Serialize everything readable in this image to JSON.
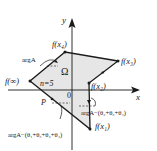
{
  "diagram": {
    "type": "conformal-polygon-map",
    "axes": {
      "x_label": "x",
      "y_label": "y",
      "origin_label": "0"
    },
    "region": {
      "label": "Ω",
      "n_label": "n=5",
      "fill": "#e6e6e6"
    },
    "vertices": [
      {
        "id": "f_x4",
        "label": "f(x₄)"
      },
      {
        "id": "f_x3",
        "label": "f(x₃)"
      },
      {
        "id": "f_x2",
        "label": "f(x₂)"
      },
      {
        "id": "f_x1",
        "label": "f(x₁)"
      },
      {
        "id": "f_inf",
        "label": "f(∞)"
      }
    ],
    "point_label": "P",
    "angle_labels": {
      "top": "argA",
      "right": "argA−(θ₂+θ₃+θ₄)",
      "bottom": "argA−(θ₁+θ₂+θ₃+θ₄)"
    },
    "colors": {
      "line": "#1a1a1a",
      "axis": "#1a1a1a",
      "background": "#ffffff"
    }
  }
}
